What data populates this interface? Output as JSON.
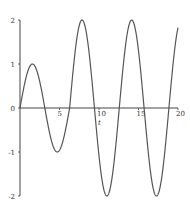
{
  "chart_data": {
    "type": "line",
    "title": "",
    "xlabel": "t",
    "ylabel": "",
    "xlim": [
      0,
      20
    ],
    "ylim": [
      -2,
      2
    ],
    "grid": false,
    "legend": null,
    "x_ticks": [
      5,
      10,
      15,
      20
    ],
    "x_tick_labels": [
      "5",
      "10",
      "15",
      "20"
    ],
    "y_ticks": [
      2,
      1,
      0,
      -1,
      -2
    ],
    "y_tick_labels": [
      "2",
      "1",
      "0",
      "-1",
      "-2"
    ],
    "series": [
      {
        "name": "y(t)",
        "description": "sin(t) for t < 2π, 2·sin(t) for t ≥ 2π",
        "key_points": [
          {
            "t": 0,
            "y": 0
          },
          {
            "t": 1.57,
            "y": 1
          },
          {
            "t": 3.14,
            "y": 0
          },
          {
            "t": 4.71,
            "y": -1
          },
          {
            "t": 6.28,
            "y": 0
          },
          {
            "t": 7.85,
            "y": 2
          },
          {
            "t": 9.42,
            "y": 0
          },
          {
            "t": 11.0,
            "y": -2
          },
          {
            "t": 12.57,
            "y": 0
          },
          {
            "t": 14.14,
            "y": 2
          },
          {
            "t": 15.71,
            "y": 0
          },
          {
            "t": 17.28,
            "y": -2
          },
          {
            "t": 18.85,
            "y": 0
          },
          {
            "t": 20,
            "y": 1.83
          }
        ],
        "color": "#555555"
      }
    ]
  },
  "layout": {
    "origin_px": [
      20,
      108
    ],
    "x_px_per_unit": 7.9,
    "y_px_per_unit": 44,
    "axis_color": "#444444",
    "curve_color": "#555555"
  }
}
